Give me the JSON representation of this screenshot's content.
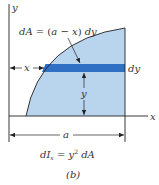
{
  "figure": {
    "caption": "(b)",
    "axes": {
      "x_label": "x",
      "y_label": "y"
    },
    "strip_label": "dA = (a − x) dy",
    "strip_label_parts": {
      "dA": "dA",
      "eq": " = (",
      "a": "a",
      "minus": " − ",
      "x": "x",
      "close": ") ",
      "dy": "dy"
    },
    "thickness_label": "dy",
    "height_label": "y",
    "left_distance_label": "x",
    "width_label": "a",
    "formula": {
      "lhs_d": "d",
      "lhs_I": "I",
      "lhs_sub": "x",
      "eq": " = ",
      "y": "y",
      "exp": "2",
      "rhs": " dA"
    },
    "colors": {
      "region_fill": "#b9d5ee",
      "strip_fill": "#2f6fc4",
      "line": "#222222"
    }
  }
}
